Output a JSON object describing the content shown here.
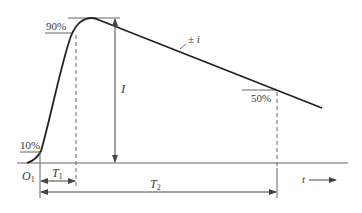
{
  "diagram": {
    "type": "impulse-current-waveform",
    "curve_label": "± i",
    "peak_label": "I",
    "origin_label": {
      "main": "O",
      "sub": "1"
    },
    "time_axis_label": "t",
    "markers": {
      "ten_percent": "10%",
      "ninety_percent": "90%",
      "fifty_percent": "50%"
    },
    "intervals": {
      "t1": {
        "main": "T",
        "sub": "1"
      },
      "t2": {
        "main": "T",
        "sub": "2"
      }
    },
    "colors": {
      "curve": "#222222",
      "lines": "#555555",
      "text": "#3a3a3a",
      "background": "#ffffff"
    }
  }
}
